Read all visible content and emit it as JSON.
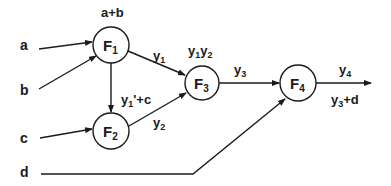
{
  "diagram": {
    "type": "function-composition-dataflow",
    "inputs": [
      {
        "id": "a",
        "label": "a"
      },
      {
        "id": "b",
        "label": "b"
      },
      {
        "id": "c",
        "label": "c"
      },
      {
        "id": "d",
        "label": "d"
      }
    ],
    "nodes": [
      {
        "id": "F1",
        "name": "F",
        "sub": "1",
        "annotation": "a+b"
      },
      {
        "id": "F2",
        "name": "F",
        "sub": "2",
        "annotation_base": "y",
        "annotation_sub": "1",
        "annotation_rest": "'+c"
      },
      {
        "id": "F3",
        "name": "F",
        "sub": "3",
        "annotation_parts": [
          "y",
          "1",
          "y",
          "2"
        ]
      },
      {
        "id": "F4",
        "name": "F",
        "sub": "4",
        "annotation_base": "y",
        "annotation_sub": "3",
        "annotation_rest": "+d"
      }
    ],
    "edges": [
      {
        "from": "a",
        "to": "F1"
      },
      {
        "from": "b",
        "to": "F1"
      },
      {
        "from": "F1",
        "to": "F2"
      },
      {
        "from": "c",
        "to": "F2"
      },
      {
        "from": "F1",
        "to": "F3",
        "label_base": "y",
        "label_sub": "1"
      },
      {
        "from": "F2",
        "to": "F3",
        "label_base": "y",
        "label_sub": "2"
      },
      {
        "from": "F3",
        "to": "F4",
        "label_base": "y",
        "label_sub": "3"
      },
      {
        "from": "d",
        "to": "F4"
      },
      {
        "from": "F4",
        "to": "output",
        "label_base": "y",
        "label_sub": "4"
      }
    ]
  }
}
